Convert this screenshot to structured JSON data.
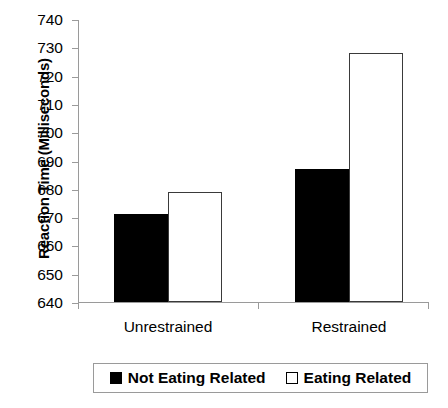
{
  "chart_data": {
    "type": "bar",
    "title": "",
    "xlabel": "",
    "ylabel": "Reaction Time (Milliseconds)",
    "categories": [
      "Unrestrained",
      "Restrained"
    ],
    "series": [
      {
        "name": "Not Eating Related",
        "color": "#000000",
        "fill": "solid",
        "values": [
          671,
          687
        ]
      },
      {
        "name": "Eating Related",
        "color": "#ffffff",
        "fill": "open",
        "values": [
          679,
          728
        ]
      }
    ],
    "ylim": [
      640,
      740
    ],
    "ytick_step": 10,
    "yticks": [
      640,
      650,
      660,
      670,
      680,
      690,
      700,
      710,
      720,
      730,
      740
    ],
    "ytick_labels": [
      "640",
      "650",
      "660",
      "670",
      "680",
      "690",
      "700",
      "710",
      "720",
      "730",
      "740"
    ],
    "grid": false,
    "legend_position": "bottom"
  },
  "legend": {
    "items": [
      {
        "label": "Not Eating Related",
        "marker": "filled-square-icon"
      },
      {
        "label": "Eating Related",
        "marker": "open-square-icon"
      }
    ]
  }
}
